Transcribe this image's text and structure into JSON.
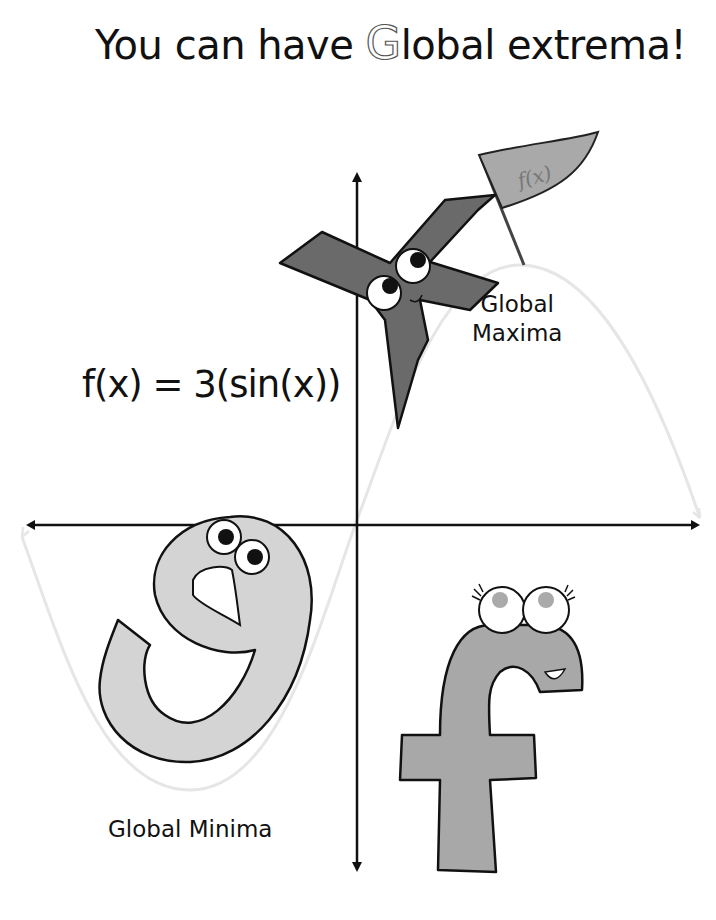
{
  "title": {
    "prefix": "You can have ",
    "highlight_letter": "G",
    "suffix": "lobal extrema!"
  },
  "formula": "f(x) = 3(sin(x))",
  "labels": {
    "global_maxima": [
      "Global",
      "Maxima"
    ],
    "global_minima": "Global Minima"
  },
  "flag_text": "f(x)",
  "characters": [
    {
      "letter": "x",
      "role": "standing on global maximum holding flag",
      "color": "#6a6a6a"
    },
    {
      "letter": "g",
      "role": "at global minimum",
      "color": "#d4d4d4"
    },
    {
      "letter": "f",
      "role": "in fourth quadrant",
      "color": "#a8a8a8"
    }
  ],
  "colors": {
    "axis": "#111111",
    "curve": "#e6e6e6",
    "flag": "#a9a9a9",
    "outline": "#111111"
  }
}
